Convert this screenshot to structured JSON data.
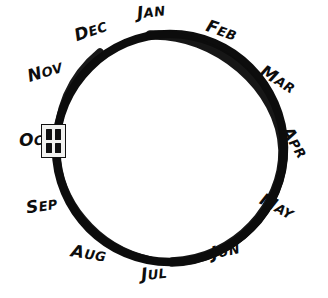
{
  "diagram": {
    "type": "circular-cycle",
    "stroke_color": "#0d0d0d",
    "background_color": "#ffffff",
    "circle": {
      "center_x": 170,
      "center_y": 148,
      "radius": 114,
      "stroke_width": 8
    },
    "marker": {
      "name": "oct-marker",
      "cell_count": 4,
      "fill_color": "#f2f2f0",
      "border_color": "#101010",
      "cell_color": "#111111",
      "at_month": "OCT",
      "x": 41,
      "y": 124,
      "width": 25,
      "height": 34
    },
    "months": [
      {
        "id": "jan",
        "lead": "J",
        "rest": "AN",
        "label": "JAN",
        "angle_deg": -90
      },
      {
        "id": "feb",
        "lead": "F",
        "rest": "EB",
        "label": "FEB",
        "angle_deg": -60
      },
      {
        "id": "mar",
        "lead": "M",
        "rest": "AR",
        "label": "MAR",
        "angle_deg": -30
      },
      {
        "id": "apr",
        "lead": "A",
        "rest": "PR",
        "label": "APR",
        "angle_deg": 0
      },
      {
        "id": "may",
        "lead": "M",
        "rest": "AY",
        "label": "MAY",
        "angle_deg": 30
      },
      {
        "id": "jun",
        "lead": "J",
        "rest": "UN",
        "label": "JUN",
        "angle_deg": 60
      },
      {
        "id": "jul",
        "lead": "J",
        "rest": "UL",
        "label": "JUL",
        "angle_deg": 90
      },
      {
        "id": "aug",
        "lead": "A",
        "rest": "UG",
        "label": "AUG",
        "angle_deg": 120
      },
      {
        "id": "sep",
        "lead": "S",
        "rest": "EP",
        "label": "SEP",
        "angle_deg": 150
      },
      {
        "id": "oct",
        "lead": "O",
        "rest": "CT",
        "label": "OCT",
        "angle_deg": 180
      },
      {
        "id": "nov",
        "lead": "N",
        "rest": "OV",
        "label": "NOV",
        "angle_deg": 210
      },
      {
        "id": "dec",
        "lead": "D",
        "rest": "EC",
        "label": "DEC",
        "angle_deg": 240
      }
    ]
  }
}
